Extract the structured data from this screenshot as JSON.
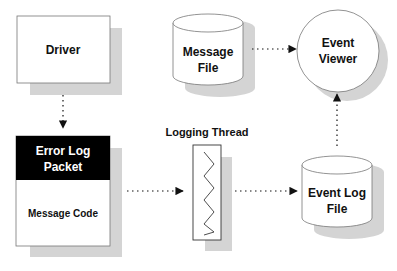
{
  "diagram": {
    "nodes": {
      "driver": {
        "label": "Driver"
      },
      "error_log_packet": {
        "header_line1": "Error Log",
        "header_line2": "Packet",
        "body": "Message Code"
      },
      "message_file": {
        "line1": "Message",
        "line2": "File"
      },
      "event_viewer": {
        "line1": "Event",
        "line2": "Viewer"
      },
      "logging_thread": {
        "label": "Logging Thread"
      },
      "event_log_file": {
        "line1": "Event Log",
        "line2": "File"
      }
    },
    "edges": [
      {
        "from": "Driver",
        "to": "Error Log Packet",
        "style": "dotted"
      },
      {
        "from": "Error Log Packet",
        "to": "Logging Thread",
        "style": "dotted"
      },
      {
        "from": "Logging Thread",
        "to": "Event Log File",
        "style": "dotted"
      },
      {
        "from": "Event Log File",
        "to": "Event Viewer",
        "style": "dotted"
      },
      {
        "from": "Message File",
        "to": "Event Viewer",
        "style": "dotted"
      }
    ],
    "colors": {
      "shadow": "#d4d4d4",
      "outline": "#555555",
      "header_fill": "#000000",
      "node_fill": "#ffffff",
      "text": "#111111",
      "arrow": "#111111"
    }
  }
}
